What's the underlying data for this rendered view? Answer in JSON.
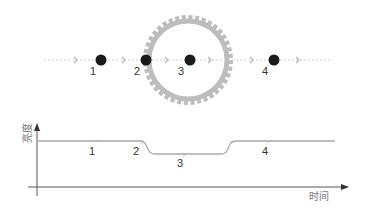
{
  "diagram": {
    "title": "",
    "colors": {
      "planet": "#1a1a1a",
      "star_ring": "#b8b8b8",
      "path": "#cfcfcf",
      "curve": "#aaaaaa",
      "axis": "#555555"
    },
    "orbit_points": [
      {
        "label": "1",
        "x": 101
      },
      {
        "label": "2",
        "x": 146
      },
      {
        "label": "3",
        "x": 190
      },
      {
        "label": "4",
        "x": 274
      }
    ],
    "star_icon": "sun-gear-icon",
    "light_curve": {
      "ylabel": "亮度",
      "xlabel": "时间",
      "markers": [
        {
          "label": "1"
        },
        {
          "label": "2"
        },
        {
          "label": "3"
        },
        {
          "label": "4"
        }
      ]
    }
  }
}
